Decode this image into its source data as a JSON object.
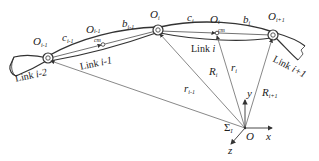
{
  "figure": {
    "joints": [
      {
        "name": "O",
        "sub": "i-1"
      },
      {
        "name": "O",
        "sub": "i"
      },
      {
        "name": "O",
        "sub": "i+1"
      }
    ],
    "centers_of_mass": [
      {
        "name": "O",
        "sub": "cm",
        "sup": "i-1"
      },
      {
        "name": "O",
        "sub": "cm",
        "sup": "i"
      }
    ],
    "segment_labels": [
      {
        "name": "c",
        "sub": "i-1"
      },
      {
        "name": "b",
        "sub": "i-1"
      },
      {
        "name": "c",
        "sub": "i"
      },
      {
        "name": "b",
        "sub": "i"
      }
    ],
    "links": [
      {
        "text": "Link ",
        "index": "i-2"
      },
      {
        "text": "Link ",
        "index": "i-1"
      },
      {
        "text": "Link ",
        "index": "i"
      },
      {
        "text": "Link ",
        "index": "i+1"
      }
    ],
    "vectors": [
      {
        "name": "r",
        "sub": "i-1"
      },
      {
        "name": "R",
        "sub": "i"
      },
      {
        "name": "r",
        "sub": "i"
      },
      {
        "name": "R",
        "sub": "i+1"
      }
    ],
    "frame": {
      "name": "Σ",
      "sub": "I",
      "origin": "O",
      "axes": {
        "x": "x",
        "y": "y",
        "z": "z"
      }
    }
  },
  "colors": {
    "stroke": "#333333",
    "thin": "#555555",
    "background": "#ffffff"
  }
}
